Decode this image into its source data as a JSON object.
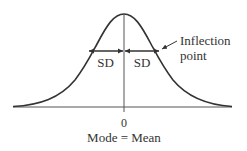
{
  "diagram": {
    "type": "normal-distribution-curve",
    "labels": {
      "sd_left": "SD",
      "sd_right": "SD",
      "inflection": [
        "Inflection",
        "point"
      ],
      "zero": "0",
      "mode_mean": "Mode = Mean"
    },
    "colors": {
      "curve": "#333333",
      "axis": "#555555",
      "text": "#333333"
    }
  }
}
